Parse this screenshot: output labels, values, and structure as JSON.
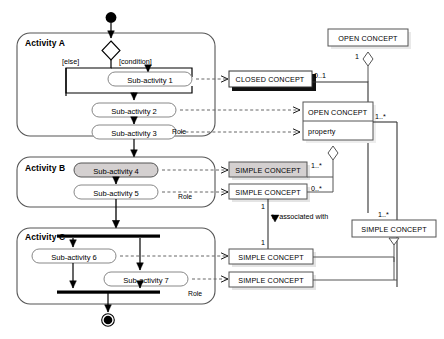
{
  "diagram": {
    "type": "uml-activity-class-mapping",
    "activities": [
      {
        "name": "Activity A",
        "role_label": "Role",
        "sub_activities": [
          {
            "label": "Sub-activity 1",
            "shaded": false
          },
          {
            "label": "Sub-activity 2",
            "shaded": false
          },
          {
            "label": "Sub-activity 3",
            "shaded": false
          }
        ],
        "guards": [
          "[else]",
          "[condition]"
        ]
      },
      {
        "name": "Activity B",
        "role_label": "Role",
        "sub_activities": [
          {
            "label": "Sub-activity 4",
            "shaded": true
          },
          {
            "label": "Sub-activity 5",
            "shaded": false
          }
        ],
        "guards": []
      },
      {
        "name": "Activity C",
        "role_label": "Role",
        "sub_activities": [
          {
            "label": "Sub-activity 6",
            "shaded": false
          },
          {
            "label": "Sub-activity 7",
            "shaded": false
          }
        ],
        "guards": []
      }
    ],
    "classes": [
      {
        "id": "open-concept-top",
        "label": "OPEN CONCEPT",
        "shaded": false,
        "shadow": "light"
      },
      {
        "id": "closed-concept",
        "label": "CLOSED CONCEPT",
        "shaded": false,
        "shadow": "dark"
      },
      {
        "id": "open-concept-property",
        "label": "OPEN CONCEPT",
        "compartment": "property",
        "shaded": false,
        "shadow": "light"
      },
      {
        "id": "simple-concept-b1",
        "label": "SIMPLE CONCEPT",
        "shaded": true,
        "shadow": "light"
      },
      {
        "id": "simple-concept-b2",
        "label": "SIMPLE CONCEPT",
        "shaded": false,
        "shadow": "light"
      },
      {
        "id": "simple-concept-right",
        "label": "SIMPLE CONCEPT",
        "shaded": false,
        "shadow": "none"
      },
      {
        "id": "simple-concept-c1",
        "label": "SIMPLE CONCEPT",
        "shaded": false,
        "shadow": "light"
      },
      {
        "id": "simple-concept-c2",
        "label": "SIMPLE CONCEPT",
        "shaded": false,
        "shadow": "light"
      }
    ],
    "multiplicities": [
      {
        "id": "m-open-top",
        "value": "1"
      },
      {
        "id": "m-closed",
        "value": "0..1"
      },
      {
        "id": "m-open-prop-right",
        "value": "1..*"
      },
      {
        "id": "m-simple-b1",
        "value": "1..*"
      },
      {
        "id": "m-simple-b2",
        "value": "0..*"
      },
      {
        "id": "m-assoc-top",
        "value": "1"
      },
      {
        "id": "m-assoc-bottom",
        "value": "1"
      },
      {
        "id": "m-simple-right",
        "value": "1..*"
      }
    ],
    "association_label": "is associated with"
  }
}
